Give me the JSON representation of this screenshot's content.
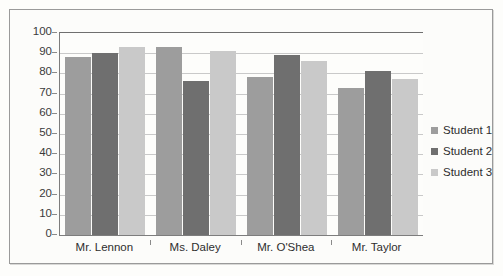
{
  "chart_data": {
    "type": "bar",
    "title": "",
    "subtitle": "",
    "xlabel": "",
    "ylabel": "",
    "ylim": [
      0,
      100
    ],
    "y_ticks": [
      0,
      10,
      20,
      30,
      40,
      50,
      60,
      70,
      80,
      90,
      100
    ],
    "grid": true,
    "legend_position": "right",
    "categories": [
      "Mr. Lennon",
      "Ms. Daley",
      "Mr. O'Shea",
      "Mr. Taylor"
    ],
    "series": [
      {
        "name": "Student 1",
        "color": "#9d9d9d",
        "values": [
          88,
          93,
          78,
          73
        ]
      },
      {
        "name": "Student 2",
        "color": "#6f6f6f",
        "values": [
          90,
          76,
          89,
          81
        ]
      },
      {
        "name": "Student 3",
        "color": "#c9c9c9",
        "values": [
          93,
          91,
          86,
          77
        ]
      }
    ]
  },
  "legend": {
    "items": [
      {
        "label": "Student 1"
      },
      {
        "label": "Student 2"
      },
      {
        "label": "Student 3"
      }
    ]
  }
}
